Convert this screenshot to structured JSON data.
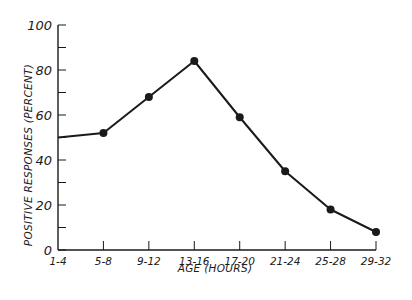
{
  "chart_data": {
    "type": "line",
    "title": "",
    "xlabel": "AGE (HOURS)",
    "ylabel": "POSITIVE RESPONSES (PERCENT)",
    "categories": [
      "1-4",
      "5-8",
      "9-12",
      "13-16",
      "17-20",
      "21-24",
      "25-28",
      "29-32"
    ],
    "series": [
      {
        "name": "Positive responses",
        "values": [
          50,
          52,
          68,
          84,
          59,
          35,
          18,
          8
        ],
        "markers": [
          false,
          true,
          true,
          true,
          true,
          true,
          true,
          true
        ]
      }
    ],
    "ylim": [
      0,
      100
    ],
    "yticks": [
      "0",
      "20",
      "40",
      "60",
      "80",
      "100"
    ],
    "grid": false,
    "legend": null
  },
  "style": {
    "line_color": "#1a1a1a",
    "background": "#ffffff"
  }
}
